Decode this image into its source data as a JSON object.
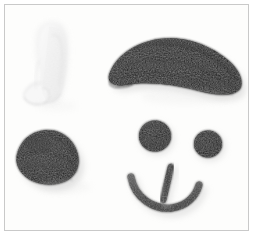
{
  "scene": {
    "title": "Felt craft face pieces on white background",
    "description": "Black and white fabric cut-outs arranged as facial features",
    "background_color": "#fdfdfc",
    "border_color": "#c9c9c9",
    "frame_width": 253,
    "frame_height": 235
  },
  "palette": {
    "black_felt": "#1b1b1b",
    "black_felt_dark": "#121212",
    "black_felt_light": "#2e2e2e",
    "white_felt": "#f2f2f2",
    "white_felt_shadow": "#e4e4e4",
    "gray_cord": "#3e3e3e",
    "gray_cord_light": "#555555",
    "shadow": "#dedede",
    "background": "#fdfdfc"
  },
  "objects": [
    {
      "id": "white-shape",
      "name": "white felt piece",
      "material": "white felt",
      "color": "#f2f2f2",
      "position": "upper left",
      "bbox": [
        22,
        20,
        58,
        80
      ]
    },
    {
      "id": "hair-swoosh",
      "name": "black felt hair swoosh",
      "material": "black felt",
      "color": "#1b1b1b",
      "position": "upper right",
      "bbox": [
        105,
        40,
        140,
        62
      ]
    },
    {
      "id": "black-blob",
      "name": "black felt rounded blob",
      "material": "black felt",
      "color": "#1b1b1b",
      "position": "lower left",
      "bbox": [
        8,
        130,
        76,
        55
      ]
    },
    {
      "id": "eye-left",
      "name": "black felt circle eye left",
      "material": "black felt",
      "color": "#1b1b1b",
      "position": "center",
      "bbox": [
        135,
        115,
        32,
        32
      ]
    },
    {
      "id": "eye-right",
      "name": "black felt circle eye right",
      "material": "black felt",
      "color": "#1b1b1b",
      "position": "center right",
      "bbox": [
        189,
        124,
        28,
        28
      ]
    },
    {
      "id": "mouth-arc",
      "name": "gray cord smile arc",
      "material": "gray cord",
      "color": "#3e3e3e",
      "position": "lower center",
      "bbox": [
        129,
        170,
        70,
        35
      ]
    },
    {
      "id": "mouth-bar",
      "name": "gray cord vertical bar",
      "material": "gray cord",
      "color": "#2f2f2f",
      "position": "lower center",
      "bbox": [
        158,
        163,
        10,
        33
      ]
    }
  ]
}
